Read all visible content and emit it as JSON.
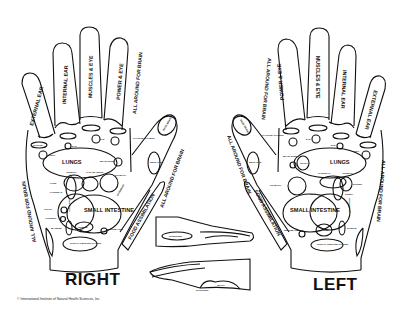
{
  "labels": {
    "right_hand": "RIGHT",
    "left_hand": "LEFT",
    "copyright": "© International Institute of Natural Health Sciences, Inc"
  },
  "right": {
    "fingers": {
      "pinky": "EXTERNAL EAR",
      "ring": "INTERNAL EAR",
      "middle": "MUSCLES & EYE",
      "index": "POWER & EYE"
    },
    "thumb_tip": "BASE BRAIN",
    "side_index": "ALL AROUND FOR BRAIN",
    "side_thumb": "ALL AROUND FOR BRAIN",
    "side_pinky": "ALL AROUND FOR BRAIN",
    "food": "FOOD ASSIMILATION",
    "neck": "NECK EYE",
    "thymus": "THYROID THYMUS",
    "parotid": "PAROTID",
    "ear": "EAR",
    "teeth": "TEETH",
    "nose": "NOSE",
    "ear2": "EAR",
    "eye": "EYE",
    "skull": "SKULL",
    "lungs": "LUNGS",
    "brain": "BRAIN SLEEP",
    "adrenal": "ADRENAL",
    "gall": "GALL BLADDER",
    "liver": "LIVER",
    "pancreas": "PANCREAS",
    "stomach": "STOMACH",
    "duodenum": "DUODENUM",
    "colon": "COLON",
    "ascending": "ASCENDING",
    "small_intestine": "SMALL INTESTINE",
    "appendix": "APPENDIX",
    "bladder": "BLADDER",
    "sigmoid": "SIGMOID",
    "rectum": "RECTUM ANUS",
    "throat": "THROAT, PENIS SEX GLANDS"
  },
  "left": {
    "fingers": {
      "index": "POWER & EYE",
      "middle": "MUSCLES & EYE",
      "ring": "INTERNAL EAR",
      "pinky": "EXTERNAL EAR"
    },
    "thumb_tip": "BASE BRAIN",
    "side_index": "ALL AROUND FOR BRAIN",
    "side_thumb": "ALL AROUND FOR BRAIN",
    "side_pinky": "ALL AROUND FOR BRAIN",
    "food": "FOOD ASSIMILATION",
    "neck": "NECK EYE",
    "thymus": "THYROID THYMUS",
    "nose": "NOSE",
    "teeth": "TEETH",
    "ear": "EAR",
    "parotid": "PAROTID",
    "eye": "EYE",
    "ear2": "EAR",
    "skull": "SKULL",
    "brain": "BRAIN SLEEP",
    "heart": "HEART",
    "lungs": "LUNGS",
    "pancreas": "PANCREAS",
    "adrenal": "ADRENAL",
    "spleen": "SPLEEN",
    "stomach": "STOMACH",
    "transverse": "TRANSVERSE",
    "kidney": "KIDNEY",
    "small_intestine": "SMALL INTESTINE",
    "descending": "DESCENDING",
    "rectum": "RECTUM ANUS",
    "bladder": "BLADDER",
    "sigmoid": "SIGMOID",
    "throat": "THROAT, PENIS SEX GLANDS"
  },
  "side_views": {
    "upper": "INTESTINES",
    "lower_a": "HEART",
    "lower_b": "SHOULDER"
  }
}
